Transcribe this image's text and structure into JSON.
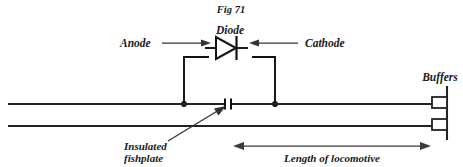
{
  "figure": {
    "caption": "Fig 71"
  },
  "labels": {
    "diode": "Diode",
    "anode": "Anode",
    "cathode": "Cathode",
    "insulated_fishplate_line1": "Insulated",
    "insulated_fishplate_line2": "fishplate",
    "length_of_locomotive": "Length of locomotive",
    "buffers": "Buffers"
  },
  "icons": {
    "anode_arrow": "arrow-right-icon",
    "cathode_arrow": "arrow-left-icon",
    "fishplate_leader": "leader-arrow-icon",
    "dimension_arrow": "double-headed-arrow-icon",
    "diode_symbol": "diode-icon",
    "buffer_stop": "buffer-stop-icon"
  },
  "colors": {
    "ink": "#111111",
    "rail": "#222222",
    "leader": "#333333",
    "background": "#ffffff"
  },
  "geometry": {
    "rail_top_y": 104,
    "rail_bottom_y": 126,
    "rail_left_x": 8,
    "rail_right_x": 432,
    "fishplate_gap_x": 228,
    "left_node_x": 184,
    "right_node_x": 275,
    "diode_center_x": 230,
    "diode_center_y": 47,
    "buffer_post_x": 440,
    "dimension_start_x": 234,
    "dimension_end_x": 430,
    "dimension_y": 146
  }
}
